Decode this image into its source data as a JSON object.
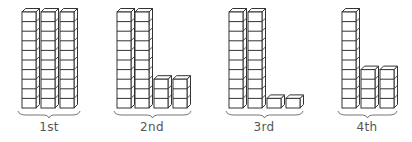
{
  "diagram": {
    "stroke_color": "#333333",
    "fill_color": "#ffffff",
    "label_color": "#555555",
    "cube_size": 9.6,
    "rod_width": 14,
    "depth": 3.5,
    "baseline_y": 108,
    "groups": [
      {
        "label": "1st",
        "tens": 3,
        "ones": 0,
        "value": 30,
        "items": [
          {
            "type": "rod",
            "x": 22,
            "cubes": 10
          },
          {
            "type": "rod",
            "x": 41,
            "cubes": 10
          },
          {
            "type": "rod",
            "x": 60,
            "cubes": 10
          }
        ],
        "brace": {
          "x1": 18,
          "x2": 80
        },
        "label_x": 49
      },
      {
        "label": "2nd",
        "tens": 2,
        "ones": 6,
        "value": 26,
        "items": [
          {
            "type": "rod",
            "x": 117,
            "cubes": 10
          },
          {
            "type": "rod",
            "x": 135,
            "cubes": 10
          },
          {
            "type": "stack",
            "x": 154,
            "cubes": 3
          },
          {
            "type": "stack",
            "x": 173,
            "cubes": 3
          }
        ],
        "brace": {
          "x1": 114,
          "x2": 191
        },
        "label_x": 152
      },
      {
        "label": "3rd",
        "tens": 2,
        "ones": 2,
        "value": 22,
        "items": [
          {
            "type": "rod",
            "x": 229,
            "cubes": 10
          },
          {
            "type": "rod",
            "x": 248,
            "cubes": 10
          },
          {
            "type": "stack",
            "x": 267,
            "cubes": 1
          },
          {
            "type": "stack",
            "x": 286,
            "cubes": 1
          }
        ],
        "brace": {
          "x1": 226,
          "x2": 303
        },
        "label_x": 264
      },
      {
        "label": "4th",
        "tens": 1,
        "ones": 8,
        "value": 18,
        "items": [
          {
            "type": "rod",
            "x": 342,
            "cubes": 10
          },
          {
            "type": "stack",
            "x": 361,
            "cubes": 4
          },
          {
            "type": "stack",
            "x": 380,
            "cubes": 4
          }
        ],
        "brace": {
          "x1": 338,
          "x2": 397
        },
        "label_x": 367
      }
    ]
  }
}
